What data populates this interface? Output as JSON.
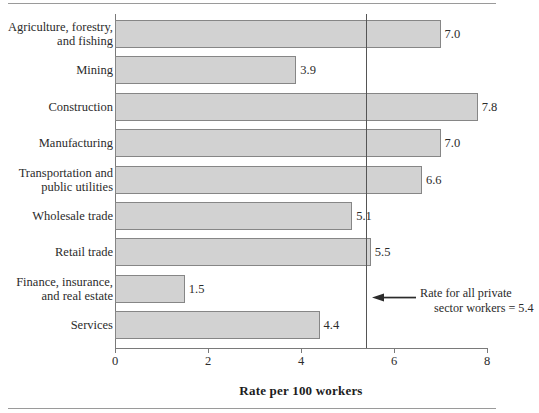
{
  "chart_data": {
    "type": "bar",
    "orientation": "horizontal",
    "title": "",
    "xlabel": "Rate per 100 workers",
    "ylabel": "",
    "xlim": [
      0,
      8
    ],
    "xticks": [
      "0",
      "2",
      "4",
      "6",
      "8"
    ],
    "grid": false,
    "legend": "none",
    "categories": [
      "Agriculture, forestry,\nand fishing",
      "Mining",
      "Construction",
      "Manufacturing",
      "Transportation and\npublic utilities",
      "Wholesale trade",
      "Retail trade",
      "Finance, insurance,\nand real estate",
      "Services"
    ],
    "values": [
      7.0,
      3.9,
      7.8,
      7.0,
      6.6,
      5.1,
      5.5,
      1.5,
      4.4
    ],
    "value_labels": [
      "7.0",
      "3.9",
      "7.8",
      "7.0",
      "6.6",
      "5.1",
      "5.5",
      "1.5",
      "4.4"
    ],
    "reference_line": {
      "value": 5.4,
      "annotation_line1": "Rate for all private",
      "annotation_line2": "sector workers = 5.4"
    },
    "bar_fill_color": "#d2d2d2",
    "bar_border_color": "#868686",
    "axis_color": "#7a7a7a",
    "reference_line_color": "#555555",
    "background_color": "#ffffff"
  },
  "rows": [
    {
      "label_line1": "Agriculture, forestry,",
      "label_line2": "and fishing",
      "value": "7.0"
    },
    {
      "label_line1": "Mining",
      "label_line2": "",
      "value": "3.9"
    },
    {
      "label_line1": "Construction",
      "label_line2": "",
      "value": "7.8"
    },
    {
      "label_line1": "Manufacturing",
      "label_line2": "",
      "value": "7.0"
    },
    {
      "label_line1": "Transportation and",
      "label_line2": "public utilities",
      "value": "6.6"
    },
    {
      "label_line1": "Wholesale trade",
      "label_line2": "",
      "value": "5.1"
    },
    {
      "label_line1": "Retail trade",
      "label_line2": "",
      "value": "5.5"
    },
    {
      "label_line1": "Finance, insurance,",
      "label_line2": "and real estate",
      "value": "1.5"
    },
    {
      "label_line1": "Services",
      "label_line2": "",
      "value": "4.4"
    }
  ],
  "axis": {
    "title": "Rate per 100 workers",
    "ticks": [
      "0",
      "2",
      "4",
      "6",
      "8"
    ]
  },
  "annotation": {
    "line1": "Rate for all private",
    "line2": "sector workers = 5.4"
  }
}
